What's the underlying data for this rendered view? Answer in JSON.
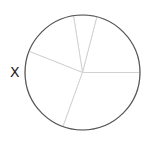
{
  "chart_data": {
    "type": "pie",
    "title": "",
    "label": "X",
    "start_angle_deg": 0,
    "direction": "counterclockwise",
    "categories": [
      "",
      "",
      "",
      "",
      ""
    ],
    "values": [
      21,
      6.5,
      16.5,
      25.5,
      30.5
    ],
    "colors": [
      "#ffffff",
      "#ffffff",
      "#ffffff",
      "#ffffff",
      "#ffffff"
    ],
    "wedge_edge_color": "#cfcfcf",
    "outline_color": "#555555",
    "legend": false
  }
}
